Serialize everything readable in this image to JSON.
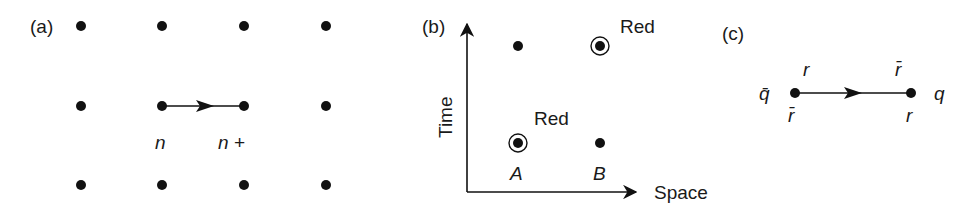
{
  "panels": {
    "a": {
      "label": "(a)",
      "grid_columns": [
        81,
        162,
        244,
        326
      ],
      "grid_rows": [
        26,
        106,
        185
      ],
      "link": {
        "from": [
          162,
          106
        ],
        "to": [
          244,
          106
        ]
      },
      "node_labels": {
        "left": "n",
        "right": "n +"
      }
    },
    "b": {
      "label": "(b)",
      "y_axis_label": "Time",
      "x_axis_label": "Space",
      "points": [
        {
          "x": 518,
          "y": 46,
          "circled": false
        },
        {
          "x": 600,
          "y": 46,
          "circled": true,
          "annotation": "Red"
        },
        {
          "x": 518,
          "y": 143,
          "circled": true,
          "annotation": "Red"
        },
        {
          "x": 600,
          "y": 143,
          "circled": false
        }
      ],
      "site_labels": {
        "a": "A",
        "b": "B"
      }
    },
    "c": {
      "label": "(c)",
      "left_particle": "q̄",
      "right_particle": "q",
      "left_top_color": "r",
      "left_bottom_color": "r̄",
      "right_top_color": "r̄",
      "right_bottom_color": "r"
    }
  }
}
